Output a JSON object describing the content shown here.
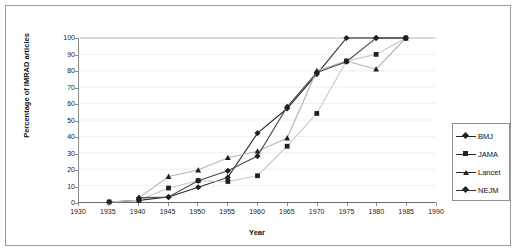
{
  "chart_data": {
    "type": "line",
    "title": "",
    "xlabel": "Year",
    "ylabel": "Percentage of IMRAD articles",
    "xlim": [
      1930,
      1990
    ],
    "ylim": [
      0,
      100
    ],
    "xticks": [
      1930,
      1935,
      1940,
      1945,
      1950,
      1955,
      1960,
      1965,
      1970,
      1975,
      1980,
      1985,
      1990
    ],
    "yticks": [
      0,
      10,
      20,
      30,
      40,
      50,
      60,
      70,
      80,
      90,
      100
    ],
    "grid": true,
    "grid_axis": "y",
    "legend_position": "right",
    "x": [
      1935,
      1940,
      1945,
      1950,
      1955,
      1960,
      1965,
      1970,
      1975,
      1980,
      1985
    ],
    "series": [
      {
        "name": "BMJ",
        "marker": "diamond",
        "color": "#2a2a2a",
        "x": [
          1935,
          1940,
          1945,
          1950,
          1955,
          1960,
          1965,
          1970,
          1975,
          1980,
          1985
        ],
        "values": [
          0,
          1,
          3,
          9,
          15,
          42,
          57,
          78,
          100,
          100,
          100
        ]
      },
      {
        "name": "JAMA",
        "marker": "square",
        "color": "#c8c8c8",
        "x": [
          1935,
          1940,
          1945,
          1950,
          1955,
          1960,
          1965,
          1970,
          1975,
          1980,
          1985
        ],
        "values": [
          0,
          1,
          8.5,
          13,
          12.5,
          16,
          34,
          54,
          86,
          90,
          100
        ]
      },
      {
        "name": "Lancet",
        "marker": "triangle",
        "color": "#b4b4b4",
        "x": [
          1940,
          1945,
          1950,
          1955,
          1960,
          1965,
          1970,
          1975,
          1980,
          1985
        ],
        "values": [
          2.5,
          15.5,
          19.5,
          27,
          31,
          39,
          80,
          86,
          81,
          100
        ]
      },
      {
        "name": "NEJM",
        "marker": "diamond",
        "color": "#4a4a4a",
        "x": [
          1940,
          1945,
          1950,
          1955,
          1960,
          1965,
          1970,
          1975,
          1980,
          1985
        ],
        "values": [
          2.5,
          3,
          13,
          19,
          28,
          58,
          79,
          85.5,
          100,
          100
        ]
      }
    ]
  },
  "axes": {
    "x_title": "Year",
    "y_title": "Percentage of IMRAD articles",
    "x_tick_labels": [
      "1930",
      "1935",
      "1940",
      "1945",
      "1950",
      "1955",
      "1960",
      "1965",
      "1970",
      "1975",
      "1980",
      "1985",
      "1990"
    ],
    "y_tick_labels": [
      "100",
      "90",
      "80",
      "70",
      "60",
      "50",
      "40",
      "30",
      "20",
      "10",
      "0"
    ]
  },
  "legend": {
    "items": [
      {
        "label": "BMJ",
        "marker": "diamond"
      },
      {
        "label": "JAMA",
        "marker": "square"
      },
      {
        "label": "Lancet",
        "marker": "triangle"
      },
      {
        "label": "NEJM",
        "marker": "diamond"
      }
    ]
  }
}
